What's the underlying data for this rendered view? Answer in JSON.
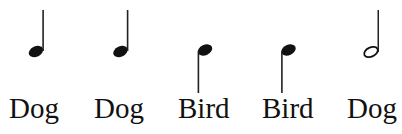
{
  "notes": [
    {
      "type": "quarter",
      "stem": "up",
      "label": "Dog"
    },
    {
      "type": "quarter",
      "stem": "up",
      "label": "Dog"
    },
    {
      "type": "quarter",
      "stem": "down",
      "label": "Bird"
    },
    {
      "type": "quarter",
      "stem": "down",
      "label": "Bird"
    },
    {
      "type": "half",
      "stem": "up",
      "label": "Dog"
    }
  ],
  "colors": {
    "ink": "#111111",
    "background": "#ffffff"
  }
}
